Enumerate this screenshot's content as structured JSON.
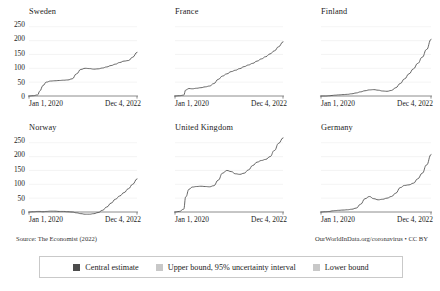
{
  "footer": {
    "source": "Source: The Economist (2022)",
    "attribution": "OurWorldInData.org/coronavirus • CC BY"
  },
  "legend": {
    "items": [
      {
        "label": "Central estimate",
        "color": "#4c4c4c",
        "icon": "square-swatch"
      },
      {
        "label": "Upper bound, 95% uncertainty interval",
        "color": "#c8c8c8",
        "icon": "square-swatch"
      },
      {
        "label": "Lower bound",
        "color": "#c8c8c8",
        "icon": "square-swatch"
      }
    ]
  },
  "axes": {
    "ytick_labels": [
      "250",
      "200",
      "150",
      "100",
      "50",
      "0"
    ],
    "xtick_left": "Jan 1, 2020",
    "xtick_right": "Dec 4, 2022"
  },
  "chart_data": {
    "type": "line",
    "title": "",
    "xlabel": "",
    "ylabel": "",
    "ylim": [
      0,
      260
    ],
    "yticks": [
      0,
      50,
      100,
      150,
      200,
      250
    ],
    "x_range": [
      "Jan 1, 2020",
      "Dec 4, 2022"
    ],
    "grid": true,
    "legend_position": "bottom",
    "x": [
      0,
      0.04,
      0.08,
      0.1,
      0.13,
      0.16,
      0.2,
      0.24,
      0.28,
      0.32,
      0.36,
      0.4,
      0.44,
      0.48,
      0.52,
      0.56,
      0.6,
      0.64,
      0.68,
      0.72,
      0.76,
      0.8,
      0.84,
      0.88,
      0.92,
      0.96,
      1
    ],
    "panels": [
      {
        "name": "Sweden",
        "series": [
          {
            "name": "Central estimate",
            "values": [
              0,
              1,
              4,
              18,
              38,
              50,
              54,
              55,
              56,
              57,
              58,
              62,
              80,
              96,
              100,
              99,
              97,
              98,
              101,
              105,
              110,
              115,
              121,
              126,
              128,
              140,
              158
            ]
          }
        ]
      },
      {
        "name": "France",
        "series": [
          {
            "name": "Central estimate",
            "values": [
              0,
              1,
              3,
              22,
              27,
              26,
              28,
              30,
              33,
              36,
              45,
              60,
              72,
              80,
              88,
              93,
              99,
              106,
              112,
              118,
              126,
              134,
              142,
              152,
              163,
              178,
              196
            ]
          }
        ]
      },
      {
        "name": "Finland",
        "series": [
          {
            "name": "Central estimate",
            "values": [
              0,
              0,
              1,
              2,
              3,
              4,
              5,
              6,
              8,
              11,
              15,
              19,
              22,
              23,
              21,
              18,
              17,
              20,
              30,
              45,
              62,
              80,
              98,
              118,
              140,
              168,
              205
            ]
          }
        ]
      },
      {
        "name": "Norway",
        "series": [
          {
            "name": "Central estimate",
            "values": [
              0,
              1,
              2,
              2,
              1,
              2,
              3,
              3,
              2,
              2,
              1,
              0,
              -3,
              -6,
              -8,
              -8,
              -6,
              -2,
              6,
              18,
              32,
              46,
              58,
              70,
              84,
              100,
              120
            ]
          }
        ]
      },
      {
        "name": "United Kingdom",
        "series": [
          {
            "name": "Central estimate",
            "values": [
              0,
              2,
              10,
              55,
              82,
              90,
              92,
              93,
              92,
              91,
              95,
              115,
              140,
              150,
              146,
              138,
              136,
              140,
              152,
              168,
              180,
              186,
              190,
              200,
              222,
              248,
              268
            ]
          }
        ]
      },
      {
        "name": "Germany",
        "series": [
          {
            "name": "Central estimate",
            "values": [
              0,
              1,
              2,
              4,
              5,
              6,
              7,
              8,
              10,
              14,
              28,
              48,
              56,
              48,
              44,
              46,
              50,
              56,
              68,
              88,
              96,
              98,
              104,
              120,
              140,
              170,
              208
            ]
          }
        ]
      }
    ]
  }
}
